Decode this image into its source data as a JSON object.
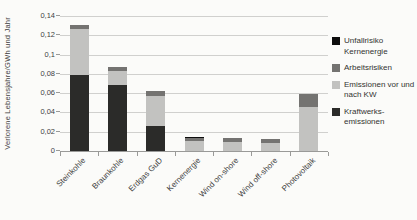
{
  "figure": {
    "background": "#fbfbf9",
    "axis_color": "#9a9a98",
    "gridline_color": "#d0d0ce",
    "text_color": "#3f3f3f"
  },
  "y_axis": {
    "title": "Verlorene Lebensjahre/GWh und Jahr",
    "tick_labels": [
      "0",
      "0,02",
      "0,04",
      "0,06",
      "0,08",
      "0,1",
      "0,12",
      "0,14"
    ]
  },
  "legend": {
    "items": [
      {
        "label": "Unfallrisiko Kernenergie",
        "color": "#0d0d0d"
      },
      {
        "label": "Arbeitsrisiken",
        "color": "#747371"
      },
      {
        "label": "Emissionen vor und nach KW",
        "color": "#c2c2c0"
      },
      {
        "label": "Kraftwerks-emissionen",
        "color": "#2b2b29"
      }
    ]
  },
  "chart_data": {
    "type": "bar",
    "stacked": true,
    "title": "",
    "xlabel": "",
    "ylabel": "Verlorene Lebensjahre/GWh und Jahr",
    "ylim": [
      0,
      0.14
    ],
    "ytick_step": 0.02,
    "grid": true,
    "legend_position": "right",
    "categories": [
      "Steinkohle",
      "Braunkohle",
      "Erdgas GuD",
      "Kernenergie",
      "Wind on-shore",
      "Wind off-shore",
      "Photovoltaik"
    ],
    "series": [
      {
        "name": "Kraftwerksemissionen",
        "color": "#2b2b29",
        "values": [
          0.079,
          0.068,
          0.026,
          0,
          0,
          0,
          0
        ]
      },
      {
        "name": "Emissionen vor und nach KW",
        "color": "#c2c2c0",
        "values": [
          0.048,
          0.015,
          0.031,
          0.01,
          0.009,
          0.008,
          0.046
        ]
      },
      {
        "name": "Arbeitsrisiken",
        "color": "#747371",
        "values": [
          0.004,
          0.004,
          0.005,
          0.004,
          0.005,
          0.004,
          0.013
        ]
      },
      {
        "name": "Unfallrisiko Kernenergie",
        "color": "#0d0d0d",
        "values": [
          0,
          0,
          0,
          0.001,
          0,
          0,
          0
        ]
      }
    ],
    "totals": [
      0.131,
      0.087,
      0.062,
      0.015,
      0.014,
      0.012,
      0.059
    ]
  }
}
